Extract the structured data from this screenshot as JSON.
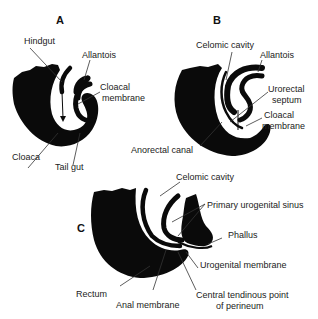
{
  "panels": {
    "a": {
      "letter": "A",
      "labels": {
        "hindgut": "Hindgut",
        "allantois": "Allantois",
        "cloacal_membrane_1": "Cloacal",
        "cloacal_membrane_2": "membrane",
        "cloaca": "Cloaca",
        "tail_gut": "Tail gut"
      }
    },
    "b": {
      "letter": "B",
      "labels": {
        "celomic_cavity": "Celomic cavity",
        "allantois": "Allantois",
        "urorectal_septum_1": "Urorectal",
        "urorectal_septum_2": "septum",
        "cloacal_membrane_1": "Cloacal",
        "cloacal_membrane_2": "membrane",
        "anorectal_canal": "Anorectal canal"
      }
    },
    "c": {
      "letter": "C",
      "labels": {
        "celomic_cavity": "Celomic cavity",
        "primary_urogenital_sinus": "Primary urogenital sinus",
        "phallus": "Phallus",
        "urogenital_membrane": "Urogenital membrane",
        "rectum": "Rectum",
        "anal_membrane": "Anal membrane",
        "central_tendinous_point_1": "Central tendinous point",
        "central_tendinous_point_2": "of perineum"
      }
    }
  },
  "colors": {
    "tissue": "#0a0a0a",
    "leader_line": "#333333",
    "background": "#ffffff"
  }
}
